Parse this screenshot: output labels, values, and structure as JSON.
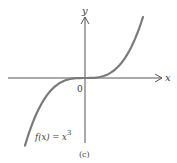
{
  "chart_data": {
    "type": "line",
    "title": "",
    "caption": "(c)",
    "function_label": "f(x) = x",
    "function_exponent": "3",
    "xlabel": "x",
    "ylabel": "y",
    "origin_label": "0",
    "series": [
      {
        "name": "f(x) = x^3",
        "color": "#7a7a7a",
        "x": [
          -1.0,
          -0.75,
          -0.5,
          -0.25,
          0,
          0.25,
          0.5,
          0.75,
          1.0
        ],
        "y": [
          -1.0,
          -0.42,
          -0.125,
          -0.016,
          0,
          0.016,
          0.125,
          0.42,
          1.0
        ]
      }
    ],
    "axes": {
      "x_arrow": true,
      "y_arrow": true,
      "grid": false,
      "ticks": false
    },
    "colors": {
      "axis": "#555555",
      "curve": "#7a7a7a",
      "text": "#3a3a3a"
    }
  }
}
